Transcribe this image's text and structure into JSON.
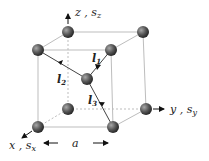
{
  "diagram": {
    "type": "bcc-lattice-cube",
    "axes": {
      "z": {
        "label": "z",
        "sub_label": "s",
        "sub": "z"
      },
      "y": {
        "label": "y",
        "sub_label": "s",
        "sub": "y"
      },
      "x": {
        "label": "x",
        "sub_label": "s",
        "sub": "x"
      }
    },
    "lattice_constant": "a",
    "vectors": [
      {
        "name": "l",
        "sub": "1"
      },
      {
        "name": "l",
        "sub": "2"
      },
      {
        "name": "l",
        "sub": "3"
      }
    ],
    "separator": ",",
    "colors": {
      "edge": "#bdbdbd",
      "sphere_dark": "#3a3a3a",
      "sphere_light": "#9a9a9a",
      "arrow": "#111111",
      "text": "#222222"
    }
  }
}
